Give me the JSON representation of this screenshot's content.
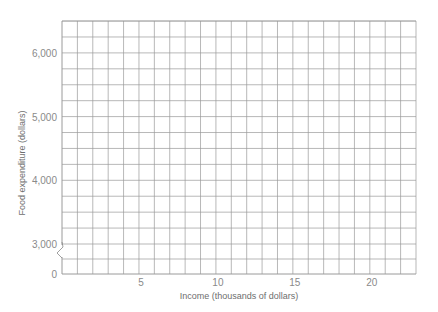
{
  "chart_data": {
    "type": "scatter",
    "title": "",
    "xlabel": "Income (thousands of dollars)",
    "ylabel": "Food expenditure (dollars)",
    "x_ticks": [
      "5",
      "10",
      "15",
      "20"
    ],
    "x_tick_values": [
      5,
      10,
      15,
      20
    ],
    "y_ticks": [
      "0",
      "3,000",
      "4,000",
      "5,000",
      "6,000"
    ],
    "y_tick_values": [
      0,
      3000,
      4000,
      5000,
      6000
    ],
    "xlim": [
      0,
      23
    ],
    "ylim": [
      2500,
      6500
    ],
    "y_axis_break": "between 0 and 3,000",
    "grid": true,
    "x_grid_step": 1,
    "y_grid_step": 250,
    "series": [],
    "note": "Blank graph-paper grid with no plotted data"
  },
  "layout": {
    "plot_left": 62,
    "plot_right": 416,
    "plot_top": 21,
    "plot_bottom": 274,
    "columns": 23,
    "rows_above_break": 14,
    "grid_color": "#9a9a9a",
    "text_color": "#8a8a8a"
  }
}
